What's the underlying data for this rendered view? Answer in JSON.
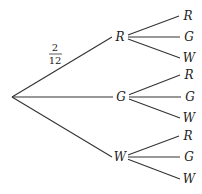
{
  "diagram": {
    "type": "probability-tree",
    "root": {
      "x": 12,
      "y": 97
    },
    "edge_label": {
      "numerator": "2",
      "denominator": "12",
      "branch": "R"
    },
    "level1": [
      {
        "label": "R",
        "x": 120,
        "y": 37,
        "children": [
          {
            "label": "R",
            "x": 186,
            "y": 16
          },
          {
            "label": "G",
            "x": 187,
            "y": 37
          },
          {
            "label": "W",
            "x": 187,
            "y": 58
          }
        ]
      },
      {
        "label": "G",
        "x": 121,
        "y": 97,
        "children": [
          {
            "label": "R",
            "x": 187,
            "y": 75
          },
          {
            "label": "G",
            "x": 188,
            "y": 97
          },
          {
            "label": "W",
            "x": 187,
            "y": 118
          }
        ]
      },
      {
        "label": "W",
        "x": 120,
        "y": 157,
        "children": [
          {
            "label": "R",
            "x": 186,
            "y": 136
          },
          {
            "label": "G",
            "x": 187,
            "y": 157
          },
          {
            "label": "W",
            "x": 187,
            "y": 179
          }
        ]
      }
    ]
  }
}
